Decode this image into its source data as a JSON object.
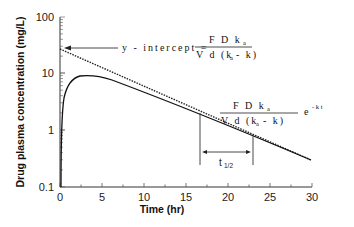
{
  "chart_data": {
    "type": "line",
    "title": "",
    "xlabel": "Time (hr)",
    "ylabel": "Drug plasma concentration (mg/L)",
    "xlim": [
      0,
      30
    ],
    "ylim": [
      0.1,
      100
    ],
    "yscale": "log",
    "x_ticks": [
      "0",
      "5",
      "10",
      "15",
      "20",
      "25",
      "30"
    ],
    "y_ticks": [
      "0.1",
      "1",
      "10",
      "100"
    ],
    "grid": false,
    "legend": null,
    "series": [
      {
        "name": "Plasma concentration (oral absorption)",
        "style": "solid",
        "x": [
          0,
          0.5,
          1,
          2,
          3,
          4,
          5,
          7,
          10,
          15,
          20,
          25,
          30
        ],
        "y": [
          0.1,
          4.0,
          6.5,
          8.6,
          9.1,
          9.0,
          8.6,
          7.3,
          5.3,
          3.0,
          1.6,
          0.85,
          0.3
        ]
      },
      {
        "name": "Terminal phase extrapolation",
        "style": "dotted",
        "x": [
          0,
          5,
          10,
          15,
          20,
          25,
          30
        ],
        "y": [
          27,
          14.5,
          7.6,
          4.0,
          2.1,
          1.05,
          0.3
        ]
      }
    ],
    "annotations": [
      {
        "text": "y - intercept = F D k_a / (V d (k_a - k))",
        "points_to": {
          "x": 0,
          "y": 27
        }
      },
      {
        "text": "F D k_a / (V d (k_a - k)) e^(-k t)",
        "position": "terminal line"
      },
      {
        "text": "t1/2",
        "span_x": [
          16.5,
          23
        ]
      }
    ]
  },
  "labels": {
    "ylabel": "Drug plasma concentration (mg/L)",
    "xlabel": "Time (hr)",
    "xticks": [
      "0",
      "5",
      "10",
      "15",
      "20",
      "25",
      "30"
    ],
    "yticks": [
      "100",
      "10",
      "1",
      "0.1"
    ],
    "intercept_prefix": "y - intercept =",
    "frac_num": "F D k",
    "frac_num_sub": "a",
    "frac_den_a": "V d (k",
    "frac_den_sub": "a",
    "frac_den_b": "- k)",
    "exp": "e",
    "exp_sup": "- k t",
    "half_life": "t",
    "half_life_sub": "1/2"
  }
}
